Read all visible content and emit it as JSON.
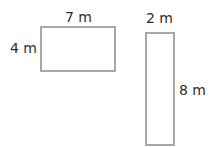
{
  "shapes": [
    {
      "name": "rectangle-a",
      "width_label": "7 m",
      "height_label": "4 m"
    },
    {
      "name": "rectangle-b",
      "width_label": "2 m",
      "height_label": "8 m"
    }
  ]
}
